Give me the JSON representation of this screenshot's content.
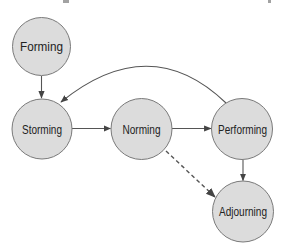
{
  "diagram": {
    "type": "flow-cycle",
    "colors": {
      "node_fill": "#dcdcdc",
      "node_stroke": "#7a7a7a",
      "edge": "#555555",
      "text": "#222222"
    },
    "nodes": [
      {
        "id": "forming",
        "label": "Forming",
        "cx": 41.5,
        "cy": 46.5,
        "r": 29
      },
      {
        "id": "storming",
        "label": "Storming",
        "cx": 42,
        "cy": 129,
        "r": 30
      },
      {
        "id": "norming",
        "label": "Norming",
        "cx": 141.5,
        "cy": 129,
        "r": 30.5
      },
      {
        "id": "performing",
        "label": "Performing",
        "cx": 242,
        "cy": 129,
        "r": 30.5
      },
      {
        "id": "adjourning",
        "label": "Adjourning",
        "cx": 243,
        "cy": 211.5,
        "r": 30.5
      }
    ],
    "edges": [
      {
        "from": "forming",
        "to": "storming",
        "style": "solid"
      },
      {
        "from": "storming",
        "to": "norming",
        "style": "solid"
      },
      {
        "from": "norming",
        "to": "performing",
        "style": "solid"
      },
      {
        "from": "performing",
        "to": "adjourning",
        "style": "solid"
      },
      {
        "from": "performing",
        "to": "storming",
        "style": "solid-curved"
      },
      {
        "from": "norming",
        "to": "adjourning",
        "style": "dashed"
      }
    ]
  }
}
